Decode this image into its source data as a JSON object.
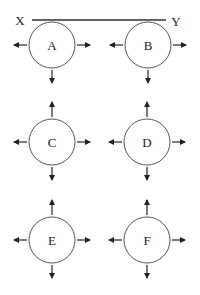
{
  "bar": {
    "left_label": "X",
    "right_label": "Y",
    "x1": 32,
    "x2": 166,
    "y": 20,
    "left_label_x": 20,
    "right_label_x": 176
  },
  "circles": [
    {
      "id": "A",
      "label": "A",
      "cx": 52,
      "cy": 45,
      "r": 23,
      "arrows": [
        "left",
        "right",
        "down"
      ]
    },
    {
      "id": "B",
      "label": "B",
      "cx": 148,
      "cy": 45,
      "r": 23,
      "arrows": [
        "left",
        "right",
        "down"
      ]
    },
    {
      "id": "C",
      "label": "C",
      "cx": 52,
      "cy": 142,
      "r": 23,
      "arrows": [
        "up",
        "left",
        "right",
        "down"
      ]
    },
    {
      "id": "D",
      "label": "D",
      "cx": 147,
      "cy": 142,
      "r": 23,
      "arrows": [
        "up",
        "left",
        "right",
        "down"
      ]
    },
    {
      "id": "E",
      "label": "E",
      "cx": 52,
      "cy": 240,
      "r": 23,
      "arrows": [
        "up",
        "left",
        "right",
        "down"
      ]
    },
    {
      "id": "F",
      "label": "F",
      "cx": 147,
      "cy": 240,
      "r": 23,
      "arrows": [
        "up",
        "left",
        "right",
        "down"
      ]
    }
  ],
  "arrow_length": 13,
  "arrow_gap": 2,
  "colors": {
    "stroke": "#222222",
    "circle": "#555555",
    "background": "#ffffff"
  }
}
